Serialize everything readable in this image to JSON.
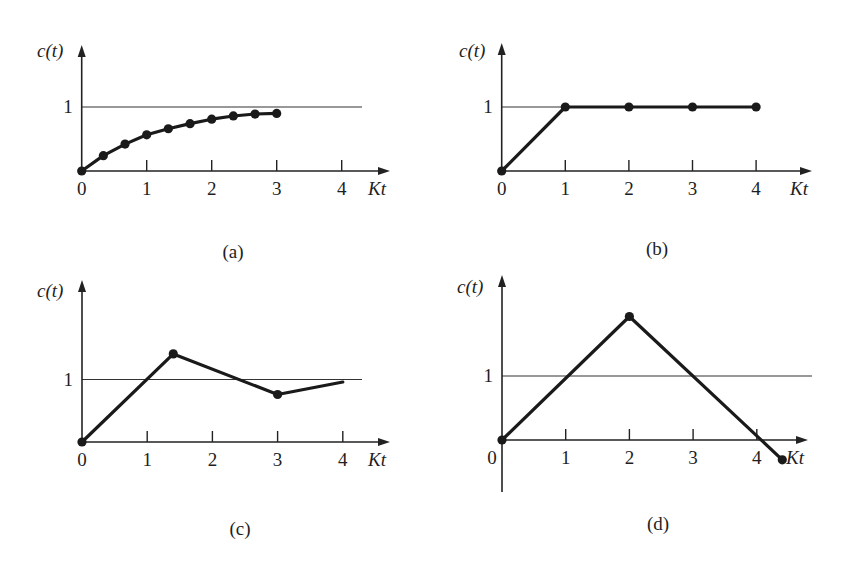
{
  "figure": {
    "width": 847,
    "height": 568,
    "colors": {
      "ink": "#1a1a1a",
      "background": "#ffffff"
    }
  },
  "chart_data": [
    {
      "id": "a",
      "type": "line",
      "caption": "(a)",
      "title": "",
      "xlabel": "Kt",
      "ylabel": "c(t)",
      "x_ticks": [
        "0",
        "1",
        "2",
        "3",
        "4"
      ],
      "y_ticks": [
        "1"
      ],
      "reference_line": {
        "y": 1,
        "label": "1"
      },
      "xlim": [
        0,
        4.4
      ],
      "ylim": [
        0,
        2
      ],
      "grid": false,
      "series": [
        {
          "name": "c(t)",
          "markers": true,
          "x": [
            0,
            0.333,
            0.667,
            1.0,
            1.333,
            1.667,
            2.0,
            2.333,
            2.667,
            3.0
          ],
          "y": [
            0,
            0.24,
            0.42,
            0.565,
            0.66,
            0.74,
            0.81,
            0.86,
            0.89,
            0.9
          ]
        }
      ]
    },
    {
      "id": "b",
      "type": "line",
      "caption": "(b)",
      "title": "",
      "xlabel": "Kt",
      "ylabel": "c(t)",
      "x_ticks": [
        "0",
        "1",
        "2",
        "3",
        "4"
      ],
      "y_ticks": [
        "1"
      ],
      "reference_line": {
        "y": 1,
        "label": "1"
      },
      "xlim": [
        0,
        4.4
      ],
      "ylim": [
        0,
        2
      ],
      "grid": false,
      "series": [
        {
          "name": "c(t)",
          "markers": true,
          "x": [
            0,
            1,
            2,
            3,
            4
          ],
          "y": [
            0,
            1,
            1,
            1,
            1
          ]
        }
      ]
    },
    {
      "id": "c",
      "type": "line",
      "caption": "(c)",
      "title": "",
      "xlabel": "Kt",
      "ylabel": "c(t)",
      "x_ticks": [
        "0",
        "1",
        "2",
        "3",
        "4"
      ],
      "y_ticks": [
        "1"
      ],
      "reference_line": {
        "y": 1,
        "label": "1"
      },
      "xlim": [
        0,
        4.4
      ],
      "ylim": [
        0,
        2.6
      ],
      "grid": false,
      "series": [
        {
          "name": "c(t)",
          "markers": [
            true,
            true,
            true,
            false
          ],
          "x": [
            0,
            1.4,
            3.0,
            4.0
          ],
          "y": [
            0,
            1.41,
            0.76,
            0.96
          ]
        }
      ]
    },
    {
      "id": "d",
      "type": "line",
      "caption": "(d)",
      "title": "",
      "xlabel": "Kt",
      "ylabel": "c(t)",
      "x_ticks": [
        "0",
        "1",
        "2",
        "3",
        "4"
      ],
      "y_ticks": [
        "1"
      ],
      "reference_line": {
        "y": 1,
        "label": "1"
      },
      "xlim": [
        0,
        4.6
      ],
      "ylim": [
        -0.8,
        2.6
      ],
      "grid": false,
      "series": [
        {
          "name": "c(t)",
          "markers": true,
          "x": [
            0,
            2,
            4.4
          ],
          "y": [
            0,
            1.93,
            -0.31
          ]
        }
      ]
    }
  ],
  "layout": [
    {
      "origin": [
        81.7,
        171
      ],
      "ux": 65,
      "uy": 64,
      "y_top": 45,
      "y_bottom": 171,
      "x_end": 390,
      "ref_end": 362,
      "ylabel_pos": [
        37,
        57
      ],
      "caption_pos": [
        233,
        258
      ],
      "zero_label_dx": 0
    },
    {
      "origin": [
        501.7,
        171
      ],
      "ux": 63.6,
      "uy": 64,
      "y_top": 43,
      "y_bottom": 171,
      "x_end": 812,
      "ref_end": 756,
      "ylabel_pos": [
        459,
        57
      ],
      "caption_pos": [
        657,
        255
      ],
      "zero_label_dx": 0
    },
    {
      "origin": [
        82,
        442
      ],
      "ux": 65.2,
      "uy": 62.5,
      "y_top": 280,
      "y_bottom": 442,
      "x_end": 390,
      "ref_end": 362,
      "ylabel_pos": [
        37,
        297
      ],
      "caption_pos": [
        240,
        535
      ],
      "zero_label_dx": 0
    },
    {
      "origin": [
        502,
        440
      ],
      "ux": 63.7,
      "uy": 64,
      "y_top": 275,
      "y_bottom": 492,
      "x_end": 808,
      "ref_end": 812,
      "ylabel_pos": [
        457,
        293
      ],
      "caption_pos": [
        658,
        530
      ],
      "zero_label_dx": -10
    }
  ]
}
